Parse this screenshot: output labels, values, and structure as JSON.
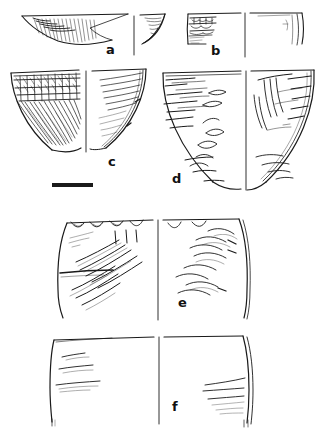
{
  "figure": {
    "caption_labels": [
      {
        "id": "a",
        "label": "a",
        "description": "shallow open bowl rim sherd with incised hatching on interior"
      },
      {
        "id": "b",
        "label": "b",
        "description": "straight-walled bowl rim sherd with punctate band below rim"
      },
      {
        "id": "c",
        "label": "c",
        "description": "deep conical bowl with banded cross-hatch and diagonal combing"
      },
      {
        "id": "d",
        "label": "d",
        "description": "hemispherical bowl with horizontal smoothing striations and surface scars"
      },
      {
        "id": "e",
        "label": "e",
        "description": "large jar body sherd with scalloped rim and diagonal burnishing marks"
      },
      {
        "id": "f",
        "label": "f",
        "description": "large plain jar body sherd with faint horizontal striations"
      }
    ],
    "scale_bar": {
      "name": "scale-bar",
      "units": "",
      "value": ""
    },
    "ink_color": "#1a1a1a",
    "background_color": "#ffffff"
  }
}
